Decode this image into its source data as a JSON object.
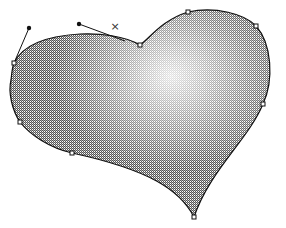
{
  "canvas": {
    "width": 286,
    "height": 228,
    "background": "#ffffff"
  },
  "shape": {
    "name": "heart",
    "fill_dark": "#9a9a9a",
    "fill_light": "#ffffff",
    "stroke": "#111111",
    "path": "M140,45 C150,38 162,20 188,12 C215,6 245,14 256,26 C272,44 274,80 263,104 C248,140 210,170 194,217 C180,190 150,170 72,153 C50,148 30,135 20,122 C12,110 8,92 11,80 C12,72 12,68 14,63 C22,46 45,36 80,34 C100,33 125,36 140,45 Z"
  },
  "anchors": [
    {
      "x": 14,
      "y": 63
    },
    {
      "x": 20,
      "y": 122
    },
    {
      "x": 72,
      "y": 153
    },
    {
      "x": 194,
      "y": 217
    },
    {
      "x": 263,
      "y": 104
    },
    {
      "x": 256,
      "y": 26
    },
    {
      "x": 188,
      "y": 12
    },
    {
      "x": 140,
      "y": 45
    }
  ],
  "handles": [
    {
      "from": {
        "x": 14,
        "y": 63
      },
      "to": {
        "x": 29,
        "y": 28
      }
    },
    {
      "from": {
        "x": 125,
        "y": 41
      },
      "to": {
        "x": 79,
        "y": 24
      }
    }
  ],
  "cursor_mark": {
    "x": 115,
    "y": 27,
    "glyph": "×"
  }
}
